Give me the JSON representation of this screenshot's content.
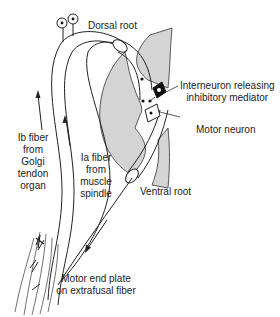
{
  "diagram": {
    "labels": {
      "dorsal_root": "Dorsal root",
      "interneuron_line1": "Interneuron releasing",
      "interneuron_line2": "inhibitory mediator",
      "motor_neuron": "Motor neuron",
      "ventral_root": "Ventral root",
      "ib_line1": "Ib fiber",
      "ib_line2": "from",
      "ib_line3": "Golgi",
      "ib_line4": "tendon",
      "ib_line5": "organ",
      "ia_line1": "Ia fiber",
      "ia_line2": "from",
      "ia_line3": "muscle",
      "ia_line4": "spindle",
      "endplate_line1": "Motor end plate",
      "endplate_line2": "on extrafusal fiber"
    },
    "colors": {
      "gray_matter": "#d4d4d4",
      "stroke": "#222222",
      "interneuron": "#111111"
    }
  }
}
